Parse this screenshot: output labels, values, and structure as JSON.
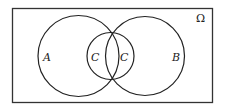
{
  "diagram": {
    "type": "venn",
    "universe": {
      "label": "Ω"
    },
    "sets": [
      {
        "id": "A",
        "label": "A"
      },
      {
        "id": "B",
        "label": "B"
      },
      {
        "id": "C",
        "label": "C"
      }
    ],
    "region_labels": {
      "a": "A",
      "b": "B",
      "c_left": "C",
      "c_right": "C"
    },
    "stroke_color": "#222222",
    "background": "#ffffff"
  }
}
